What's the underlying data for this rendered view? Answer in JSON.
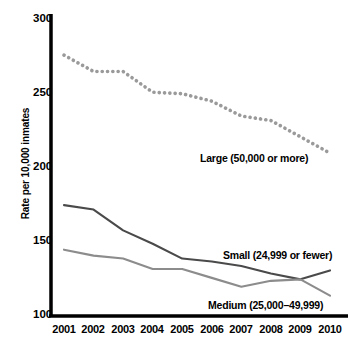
{
  "chart_data": {
    "type": "line",
    "title": "",
    "subtitle": "",
    "xlabel": "",
    "ylabel": "Rate per 10,000 inmates",
    "categories": [
      "2001",
      "2002",
      "2003",
      "2004",
      "2005",
      "2006",
      "2007",
      "2008",
      "2009",
      "2010"
    ],
    "x": [
      2001,
      2002,
      2003,
      2004,
      2005,
      2006,
      2007,
      2008,
      2009,
      2010
    ],
    "xlim": [
      2001,
      2010
    ],
    "ylim": [
      100,
      300
    ],
    "yticks": [
      100,
      150,
      200,
      250,
      300
    ],
    "ytick_labels": [
      "100",
      "150",
      "200",
      "250",
      "300"
    ],
    "grid": false,
    "legend_position": "inline-annotations",
    "series": [
      {
        "name": "Large (50,000 or more)",
        "style": "dotted",
        "color": "#9a9a9a",
        "values": [
          275,
          264,
          264,
          250,
          249,
          244,
          234,
          231,
          220,
          209
        ],
        "annotation": "Large (50,000 or more)"
      },
      {
        "name": "Small (24,999 or fewer)",
        "style": "solid",
        "color": "#4a4a4a",
        "values": [
          174,
          171,
          157,
          148,
          138,
          136,
          133,
          128,
          124,
          130
        ],
        "annotation": "Small (24,999 or fewer)"
      },
      {
        "name": "Medium (25,000–49,999)",
        "style": "solid",
        "color": "#8c8c8c",
        "values": [
          144,
          140,
          138,
          131,
          131,
          125,
          119,
          123,
          124,
          113
        ],
        "annotation": "Medium (25,000–49,999)"
      }
    ],
    "axis_color": "#000000",
    "background_color": "#ffffff"
  },
  "axes": {
    "y_axis_title": "Rate per 10,000 inmates",
    "y_tick_labels": [
      "300",
      "250",
      "200",
      "150",
      "100"
    ],
    "x_tick_labels": [
      "2001",
      "2002",
      "2003",
      "2004",
      "2005",
      "2006",
      "2007",
      "2008",
      "2009",
      "2010"
    ]
  },
  "annotations": {
    "large": "Large (50,000 or more)",
    "small": "Small (24,999 or fewer)",
    "medium": "Medium (25,000–49,999)"
  }
}
